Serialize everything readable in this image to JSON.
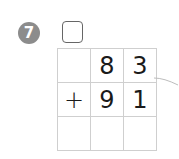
{
  "problem": {
    "number": "7",
    "answer_box_value": "",
    "rows": [
      [
        "",
        "8",
        "3"
      ],
      [
        "+",
        "9",
        "1"
      ],
      [
        "",
        "",
        ""
      ]
    ]
  },
  "colors": {
    "badge": "#8c8c8c",
    "grid_line": "#cfcfcf",
    "digit": "#1a1a1a"
  }
}
